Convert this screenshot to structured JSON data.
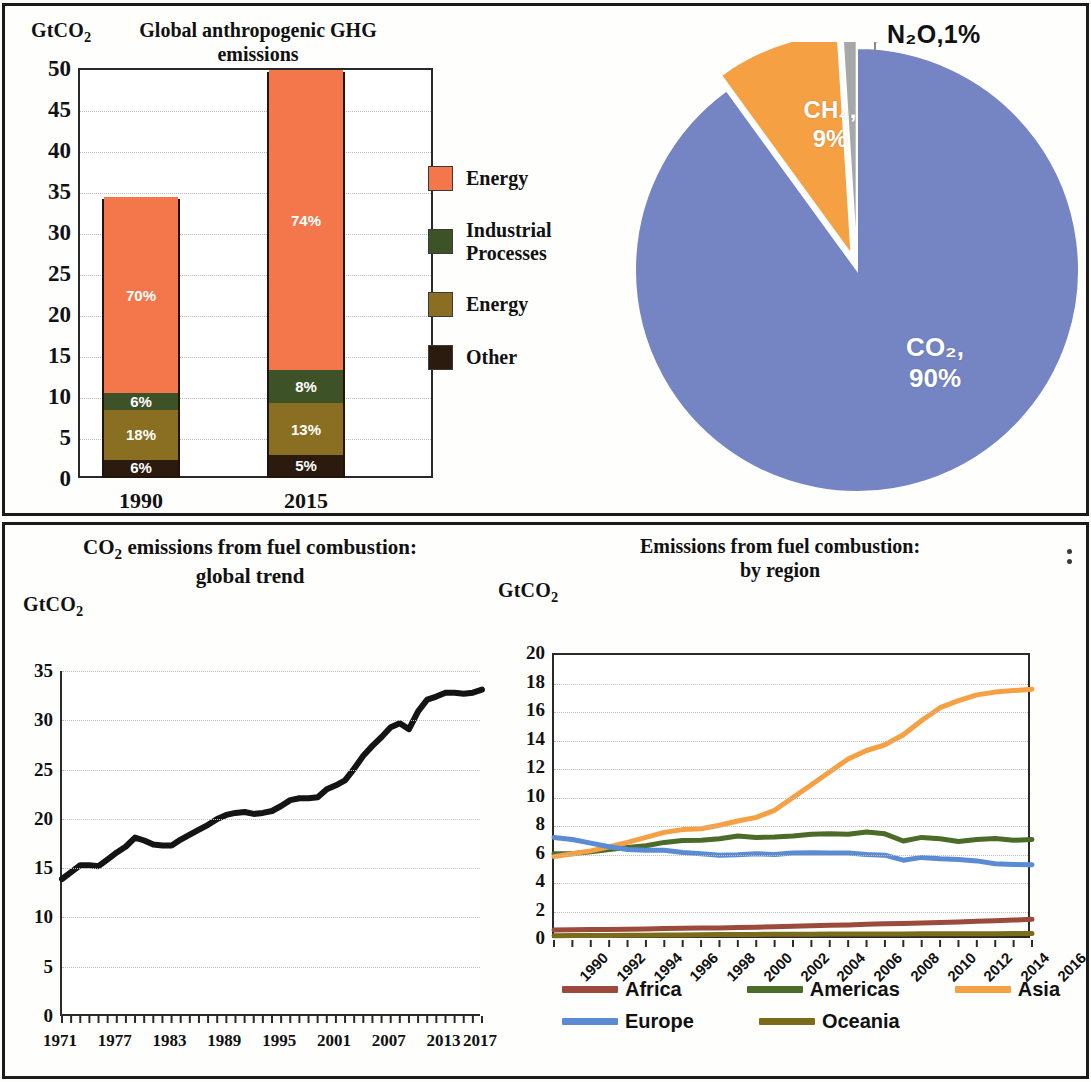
{
  "panels": {
    "bar": {
      "title": "Global anthropogenic GHG emissions",
      "unit": "GtCO₂",
      "categories": [
        "1990",
        "2015"
      ],
      "legend": [
        {
          "label": "Energy",
          "color": "#F3774A"
        },
        {
          "label": "Industrial\nProcesses",
          "color": "#3E5227"
        },
        {
          "label": "Energy",
          "color": "#8A6E21"
        },
        {
          "label": "Other",
          "color": "#2B1A0E"
        }
      ]
    },
    "pie": {
      "n2o_label": "N₂O,1%",
      "ch4_label_line1": "CH₄,",
      "ch4_label_line2": "9%",
      "co2_label_line1": "CO₂,",
      "co2_label_line2": "90%"
    },
    "trend": {
      "title_line1": "CO₂ emissions from fuel combustion:",
      "title_line2": "global trend",
      "unit": "GtCO₂"
    },
    "region": {
      "title_line1": "Emissions from fuel combustion:",
      "title_line2": "by region",
      "unit": "GtCO₂",
      "menu_icon": "kebab-menu-icon"
    }
  },
  "chart_data": [
    {
      "type": "bar",
      "title": "Global anthropogenic GHG emissions",
      "subtype": "stacked",
      "xlabel": "",
      "ylabel": "GtCO2",
      "ylim": [
        0,
        50
      ],
      "yticks": [
        0,
        5,
        10,
        15,
        20,
        25,
        30,
        35,
        40,
        45,
        50
      ],
      "grid": true,
      "categories": [
        "1990",
        "2015"
      ],
      "totals": [
        34,
        49.5
      ],
      "series": [
        {
          "name": "Other",
          "color": "#2B1A0E",
          "values": [
            2.0,
            2.5
          ],
          "labels": [
            "6%",
            "5%"
          ]
        },
        {
          "name": "Energy",
          "color": "#8A6E21",
          "values": [
            6.1,
            6.4
          ],
          "labels": [
            "18%",
            "13%"
          ]
        },
        {
          "name": "Industrial Processes",
          "color": "#3E5227",
          "values": [
            2.0,
            4.0
          ],
          "labels": [
            "6%",
            "8%"
          ]
        },
        {
          "name": "Energy",
          "color": "#F3774A",
          "values": [
            23.9,
            36.6
          ],
          "labels": [
            "70%",
            "74%"
          ]
        }
      ],
      "legend": [
        "Energy",
        "Industrial Processes",
        "Energy",
        "Other"
      ],
      "legend_position": "right"
    },
    {
      "type": "pie",
      "title": "",
      "labels": [
        "CO2",
        "CH4",
        "N2O"
      ],
      "values": [
        90,
        9,
        1
      ],
      "display_labels": [
        "CO₂, 90%",
        "CH₄, 9%",
        "N₂O,1%"
      ],
      "colors": [
        "#7585C4",
        "#F6A044",
        "#A7A7A7"
      ],
      "exploded": [
        false,
        true,
        true
      ],
      "start_angle_deg": 0
    },
    {
      "type": "line",
      "title": "CO2 emissions from fuel combustion: global trend",
      "xlabel": "",
      "ylabel": "GtCO2",
      "ylim": [
        0,
        35
      ],
      "yticks": [
        0,
        5,
        10,
        15,
        20,
        25,
        30,
        35
      ],
      "xlim": [
        1971,
        2017
      ],
      "xticks": [
        1971,
        1977,
        1983,
        1989,
        1995,
        2001,
        2007,
        2013,
        2017
      ],
      "grid": true,
      "legend_position": "none",
      "series": [
        {
          "name": "Global",
          "color": "#141414",
          "x": [
            1971,
            1972,
            1973,
            1974,
            1975,
            1976,
            1977,
            1978,
            1979,
            1980,
            1981,
            1982,
            1983,
            1984,
            1985,
            1986,
            1987,
            1988,
            1989,
            1990,
            1991,
            1992,
            1993,
            1994,
            1995,
            1996,
            1997,
            1998,
            1999,
            2000,
            2001,
            2002,
            2003,
            2004,
            2005,
            2006,
            2007,
            2008,
            2009,
            2010,
            2011,
            2012,
            2013,
            2014,
            2015,
            2016,
            2017
          ],
          "values": [
            13.9,
            14.6,
            15.3,
            15.3,
            15.2,
            15.9,
            16.6,
            17.2,
            18.1,
            17.8,
            17.4,
            17.3,
            17.3,
            17.9,
            18.4,
            18.9,
            19.4,
            20.0,
            20.4,
            20.6,
            20.7,
            20.5,
            20.6,
            20.8,
            21.3,
            21.9,
            22.1,
            22.1,
            22.2,
            23.0,
            23.4,
            23.9,
            25.1,
            26.4,
            27.4,
            28.3,
            29.3,
            29.7,
            29.1,
            30.9,
            32.1,
            32.4,
            32.8,
            32.8,
            32.7,
            32.8,
            33.1
          ]
        }
      ]
    },
    {
      "type": "line",
      "title": "Emissions from fuel combustion: by region",
      "xlabel": "",
      "ylabel": "GtCO2",
      "ylim": [
        0,
        20
      ],
      "yticks": [
        0,
        2,
        4,
        6,
        8,
        10,
        12,
        14,
        16,
        18,
        20
      ],
      "xticks": [
        "1990",
        "1992",
        "1994",
        "1996",
        "1998",
        "2000",
        "2002",
        "2004",
        "2006",
        "2008",
        "2010",
        "2012",
        "2014",
        "2016"
      ],
      "x": [
        1990,
        1991,
        1992,
        1993,
        1994,
        1995,
        1996,
        1997,
        1998,
        1999,
        2000,
        2001,
        2002,
        2003,
        2004,
        2005,
        2006,
        2007,
        2008,
        2009,
        2010,
        2011,
        2012,
        2013,
        2014,
        2015,
        2016
      ],
      "grid": true,
      "legend_position": "bottom",
      "series": [
        {
          "name": "Africa",
          "color": "#9C4A3C",
          "values": [
            0.7,
            0.72,
            0.73,
            0.74,
            0.76,
            0.78,
            0.8,
            0.82,
            0.84,
            0.85,
            0.88,
            0.9,
            0.93,
            0.96,
            1.0,
            1.03,
            1.06,
            1.1,
            1.14,
            1.16,
            1.19,
            1.22,
            1.27,
            1.31,
            1.35,
            1.4,
            1.45
          ]
        },
        {
          "name": "Americas",
          "color": "#4B6B28",
          "values": [
            6.05,
            6.05,
            6.2,
            6.35,
            6.5,
            6.62,
            6.85,
            6.98,
            7.0,
            7.1,
            7.3,
            7.2,
            7.22,
            7.3,
            7.42,
            7.45,
            7.42,
            7.58,
            7.45,
            6.95,
            7.2,
            7.1,
            6.92,
            7.05,
            7.12,
            7.0,
            7.05
          ]
        },
        {
          "name": "Asia",
          "color": "#F6A044",
          "values": [
            5.85,
            6.05,
            6.25,
            6.55,
            6.85,
            7.2,
            7.55,
            7.75,
            7.8,
            8.05,
            8.35,
            8.6,
            9.1,
            10.0,
            10.9,
            11.8,
            12.7,
            13.3,
            13.7,
            14.4,
            15.4,
            16.3,
            16.8,
            17.2,
            17.4,
            17.5,
            17.6
          ]
        },
        {
          "name": "Europe",
          "color": "#5B8BD4",
          "values": [
            7.2,
            7.05,
            6.8,
            6.55,
            6.35,
            6.3,
            6.3,
            6.15,
            6.05,
            5.95,
            5.98,
            6.05,
            6.0,
            6.1,
            6.12,
            6.1,
            6.1,
            6.0,
            5.95,
            5.6,
            5.8,
            5.7,
            5.65,
            5.55,
            5.35,
            5.3,
            5.28
          ]
        },
        {
          "name": "Oceania",
          "color": "#7A6C1B",
          "values": [
            0.3,
            0.31,
            0.32,
            0.32,
            0.33,
            0.34,
            0.35,
            0.36,
            0.37,
            0.38,
            0.38,
            0.39,
            0.4,
            0.4,
            0.41,
            0.42,
            0.42,
            0.43,
            0.43,
            0.43,
            0.44,
            0.44,
            0.44,
            0.44,
            0.44,
            0.45,
            0.45
          ]
        }
      ]
    }
  ]
}
